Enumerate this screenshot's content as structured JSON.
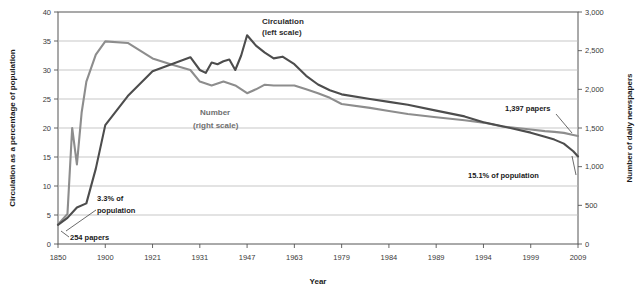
{
  "chart_data": {
    "type": "line",
    "title": "",
    "xlabel": "Year",
    "ylabel": "Circulation as a percentage of population",
    "ylabel_right": "Number of daily newspapers",
    "ylim": [
      0,
      40
    ],
    "ylim_right": [
      0,
      3000
    ],
    "ytick_labels": [
      "0",
      "5",
      "10",
      "15",
      "20",
      "25",
      "30",
      "35",
      "40"
    ],
    "ytick_values": [
      0,
      5,
      10,
      15,
      20,
      25,
      30,
      35,
      40
    ],
    "ytick_labels_right": [
      "0",
      "500",
      "1,000",
      "1,500",
      "2,000",
      "2,500",
      "3,000"
    ],
    "ytick_values_right": [
      0,
      500,
      1000,
      1500,
      2000,
      2500,
      3000
    ],
    "xtick_labels": [
      "1850",
      "1900",
      "1921",
      "1931",
      "1947",
      "1963",
      "1979",
      "1984",
      "1989",
      "1994",
      "1999",
      "2009"
    ],
    "grid": true,
    "legend_position": "inline-annotation",
    "series": [
      {
        "name": "Circulation (left scale)",
        "axis": "left",
        "color": "#4d4d4d",
        "x": [
          1850,
          1860,
          1870,
          1880,
          1890,
          1900,
          1910,
          1921,
          1925,
          1929,
          1931,
          1933,
          1935,
          1937,
          1939,
          1941,
          1943,
          1945,
          1947,
          1950,
          1953,
          1956,
          1959,
          1963,
          1967,
          1971,
          1975,
          1979,
          1982,
          1984,
          1986,
          1989,
          1992,
          1994,
          1996,
          1999,
          2002,
          2004,
          2006,
          2008,
          2009
        ],
        "values": [
          3.3,
          4.5,
          6.3,
          7.0,
          13.0,
          20.5,
          25.5,
          29.8,
          31.0,
          32.2,
          30.0,
          29.5,
          31.3,
          31.0,
          31.5,
          31.8,
          30.0,
          32.5,
          36.0,
          34.2,
          33.0,
          32.0,
          32.3,
          31.0,
          29.0,
          27.5,
          26.5,
          25.8,
          25.0,
          24.5,
          24.0,
          23.0,
          22.0,
          21.0,
          20.3,
          19.2,
          18.5,
          18.0,
          17.3,
          16.0,
          15.1
        ]
      },
      {
        "name": "Number (right scale)",
        "axis": "right",
        "color": "#8d8d8d",
        "x": [
          1850,
          1860,
          1865,
          1870,
          1875,
          1880,
          1890,
          1900,
          1910,
          1921,
          1925,
          1929,
          1931,
          1935,
          1939,
          1943,
          1947,
          1950,
          1953,
          1956,
          1959,
          1963,
          1967,
          1971,
          1975,
          1979,
          1982,
          1984,
          1986,
          1989,
          1992,
          1994,
          1996,
          1999,
          2002,
          2004,
          2006,
          2008,
          2009
        ],
        "values": [
          254,
          387,
          1500,
          1030,
          1700,
          2100,
          2450,
          2620,
          2600,
          2400,
          2320,
          2250,
          2100,
          2050,
          2100,
          2050,
          1950,
          2000,
          2060,
          2050,
          2050,
          2050,
          2000,
          1950,
          1890,
          1810,
          1760,
          1720,
          1680,
          1640,
          1600,
          1570,
          1520,
          1480,
          1460,
          1450,
          1437,
          1410,
          1397
        ]
      }
    ],
    "annotations": [
      {
        "id": "circulation-label",
        "text_lines": [
          "Circulation",
          "(left scale)"
        ]
      },
      {
        "id": "number-label",
        "text_lines": [
          "Number",
          "(right scale)"
        ]
      },
      {
        "id": "start-pct",
        "text_lines": [
          "3.3% of",
          "population"
        ]
      },
      {
        "id": "start-papers",
        "text_lines": [
          "254 papers"
        ]
      },
      {
        "id": "end-papers",
        "text_lines": [
          "1,397 papers"
        ]
      },
      {
        "id": "end-pct",
        "text_lines": [
          "15.1% of population"
        ]
      }
    ]
  }
}
